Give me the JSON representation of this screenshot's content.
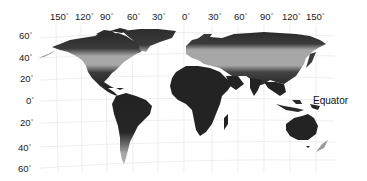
{
  "map": {
    "type": "world-map",
    "projection": "perspective-tilted-cylindrical",
    "longitude_labels": [
      {
        "text": "150",
        "x": 50
      },
      {
        "text": "120",
        "x": 75
      },
      {
        "text": "90",
        "x": 100
      },
      {
        "text": "60",
        "x": 127
      },
      {
        "text": "30",
        "x": 152
      },
      {
        "text": "0",
        "x": 182
      },
      {
        "text": "30",
        "x": 208
      },
      {
        "text": "60",
        "x": 234
      },
      {
        "text": "90",
        "x": 260
      },
      {
        "text": "120",
        "x": 285
      },
      {
        "text": "150",
        "x": 309
      }
    ],
    "latitude_labels": [
      {
        "text": "60",
        "y": 31
      },
      {
        "text": "40",
        "y": 53
      },
      {
        "text": "20",
        "y": 74
      },
      {
        "text": "0",
        "y": 96
      },
      {
        "text": "20",
        "y": 118
      },
      {
        "text": "40",
        "y": 143
      },
      {
        "text": "60",
        "y": 164
      }
    ],
    "degree_symbol": "°",
    "annotation": "Equator",
    "colors": {
      "dark_zone": "#232323",
      "mid_zone": "#555555",
      "light_zone": "#a8a8a8",
      "grid": "#e4e4e4",
      "background": "#ffffff"
    },
    "zones": [
      "dark (tropical / polar)",
      "mid-gray (temperate)",
      "light-gray (mid-latitude band)"
    ]
  }
}
